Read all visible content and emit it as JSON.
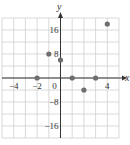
{
  "chart_data": {
    "type": "scatter",
    "title": "",
    "xlabel": "x",
    "ylabel": "y",
    "xlim": [
      -5,
      5
    ],
    "ylim": [
      -20,
      20
    ],
    "grid": true,
    "x_grid_step": 1,
    "y_grid_step": 4,
    "x_ticks": [
      -4,
      -2,
      0,
      4
    ],
    "x_tick_labels": [
      "−4",
      "−2",
      "0",
      "4"
    ],
    "y_ticks": [
      16,
      8,
      -8,
      -16
    ],
    "y_tick_labels": [
      "16",
      "8",
      "−8",
      "−16"
    ],
    "points": [
      {
        "x": -2,
        "y": 0
      },
      {
        "x": -1,
        "y": 8
      },
      {
        "x": 0,
        "y": 6
      },
      {
        "x": 1,
        "y": 0
      },
      {
        "x": 2,
        "y": -4
      },
      {
        "x": 3,
        "y": 0
      },
      {
        "x": 4,
        "y": 18
      }
    ],
    "colors": {
      "point": "#6e6e6e",
      "axis": "#333333",
      "grid": "#cfcfcf"
    }
  }
}
